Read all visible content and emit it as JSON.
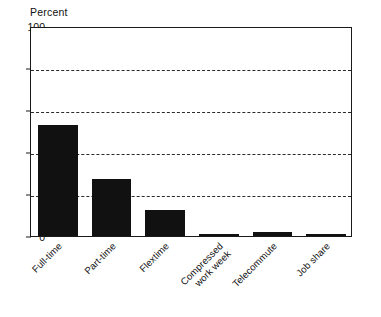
{
  "chart_data": {
    "type": "bar",
    "title": "",
    "subtitle": "",
    "xlabel": "",
    "ylabel": "Percent",
    "ylim": [
      0,
      100
    ],
    "yticks": [
      0,
      20,
      40,
      60,
      80,
      100
    ],
    "ytick_labels": [
      "0",
      "20",
      "40",
      "60",
      "80",
      "100"
    ],
    "grid": "horizontal-dashed",
    "legend": "none",
    "bar_color": "#111111",
    "categories": [
      "Full-time",
      "Part-time",
      "Flextime",
      "Compressed work week",
      "Telecommute",
      "Job share"
    ],
    "values": [
      53,
      27,
      12.5,
      1,
      2,
      1
    ],
    "series": [
      {
        "name": "Percent",
        "values": [
          53,
          27,
          12.5,
          1,
          2,
          1
        ]
      }
    ]
  },
  "axis": {
    "y_title": "Percent",
    "y_ticks": [
      {
        "label": "100",
        "value": 100
      },
      {
        "label": "80",
        "value": 80
      },
      {
        "label": "60",
        "value": 60
      },
      {
        "label": "40",
        "value": 40
      },
      {
        "label": "20",
        "value": 20
      },
      {
        "label": "0",
        "value": 0
      }
    ],
    "x_labels": [
      {
        "line1": "Full-time",
        "line2": ""
      },
      {
        "line1": "Part-time",
        "line2": ""
      },
      {
        "line1": "Flextime",
        "line2": ""
      },
      {
        "line1": "Compressed",
        "line2": "work week"
      },
      {
        "line1": "Telecommute",
        "line2": ""
      },
      {
        "line1": "Job share",
        "line2": ""
      }
    ]
  },
  "bars": [
    {
      "category": "Full-time",
      "value": 53
    },
    {
      "category": "Part-time",
      "value": 27
    },
    {
      "category": "Flextime",
      "value": 12.5
    },
    {
      "category": "Compressed work week",
      "value": 1
    },
    {
      "category": "Telecommute",
      "value": 2
    },
    {
      "category": "Job share",
      "value": 1
    }
  ]
}
